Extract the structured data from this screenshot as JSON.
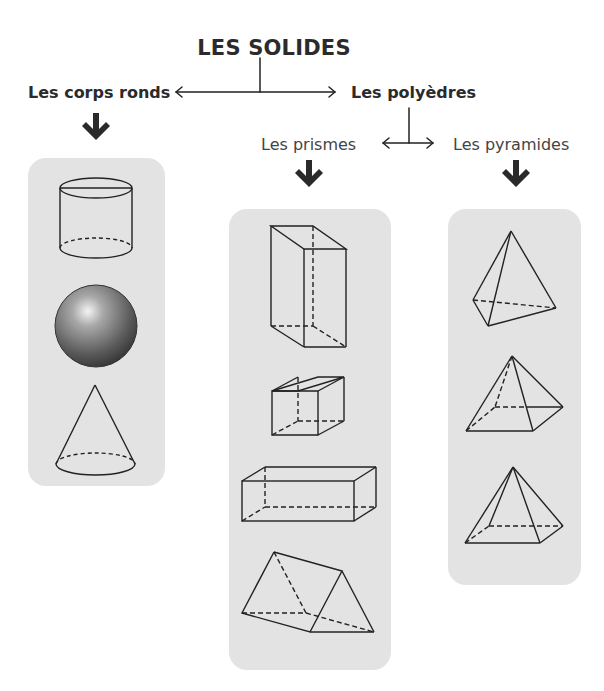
{
  "title": "LES SOLIDES",
  "branches": {
    "round": {
      "label": "Les corps ronds",
      "shapes": [
        "cylinder",
        "sphere",
        "cone"
      ]
    },
    "polyhedra": {
      "label": "Les polyèdres",
      "sub": {
        "prisms": {
          "label": "Les prismes",
          "shapes": [
            "tall-rectangular-prism",
            "cube",
            "long-rectangular-prism",
            "triangular-prism"
          ]
        },
        "pyramids": {
          "label": "Les pyramides",
          "shapes": [
            "triangular-pyramid",
            "square-pyramid",
            "rectangular-pyramid"
          ]
        }
      }
    }
  },
  "colors": {
    "text": "#2b2b2b",
    "panel": "#e3e3e3",
    "line": "#222222",
    "arrow": "#2a2a2a"
  }
}
